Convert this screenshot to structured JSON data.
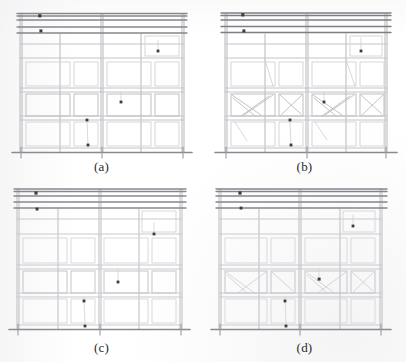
{
  "figure": {
    "kind": "scanned-engineering-drawing",
    "caption_style": "lettered-subfigures",
    "panel_count": 4,
    "background_color": "#ffffff",
    "line_color": "#b9b9bd",
    "heavy_line_color": "#7c7c82",
    "marker_color": "#3a3a3a",
    "crack_color": "#c2c2c6"
  },
  "panels": [
    {
      "id": "a",
      "label": "(a)",
      "damage_state": "none",
      "crack_bays": [],
      "markers": [
        {
          "name": "marker-top-left-upper",
          "x": 40,
          "y": 16
        },
        {
          "name": "marker-top-left-lower",
          "x": 41,
          "y": 31
        },
        {
          "name": "marker-right-upper",
          "x": 158,
          "y": 51
        },
        {
          "name": "marker-mid-center",
          "x": 121,
          "y": 102
        },
        {
          "name": "marker-lower-center-upper",
          "x": 87,
          "y": 120
        },
        {
          "name": "marker-lower-center-lower",
          "x": 88,
          "y": 145
        }
      ]
    },
    {
      "id": "b",
      "label": "(b)",
      "damage_state": "severe-diagonal-shear-cracking",
      "crack_bays": [
        "mid-left-1",
        "mid-left-2",
        "mid-right-1",
        "mid-right-2"
      ],
      "markers": [
        {
          "name": "marker-top-left-upper",
          "x": 40,
          "y": 16
        },
        {
          "name": "marker-top-left-lower",
          "x": 41,
          "y": 31
        },
        {
          "name": "marker-right-upper",
          "x": 158,
          "y": 51
        },
        {
          "name": "marker-mid-center",
          "x": 121,
          "y": 102
        },
        {
          "name": "marker-lower-center-upper",
          "x": 87,
          "y": 120
        },
        {
          "name": "marker-lower-center-lower",
          "x": 88,
          "y": 145
        }
      ]
    },
    {
      "id": "c",
      "label": "(c)",
      "damage_state": "light",
      "crack_bays": [],
      "markers": [
        {
          "name": "marker-top-left-upper",
          "x": 36,
          "y": 12
        },
        {
          "name": "marker-top-left-lower",
          "x": 37,
          "y": 28
        },
        {
          "name": "marker-right-upper",
          "x": 154,
          "y": 53
        },
        {
          "name": "marker-mid-center",
          "x": 118,
          "y": 101
        },
        {
          "name": "marker-lower-center-upper",
          "x": 84,
          "y": 120
        },
        {
          "name": "marker-lower-center-lower",
          "x": 85,
          "y": 145
        }
      ]
    },
    {
      "id": "d",
      "label": "(d)",
      "damage_state": "moderate-diagonal-cracking",
      "crack_bays": [
        "mid-left-1",
        "mid-left-2",
        "mid-right-1",
        "mid-right-2"
      ],
      "markers": [
        {
          "name": "marker-top-left-upper",
          "x": 37,
          "y": 12
        },
        {
          "name": "marker-top-left-lower",
          "x": 38,
          "y": 27
        },
        {
          "name": "marker-right-upper",
          "x": 150,
          "y": 45
        },
        {
          "name": "marker-mid-center",
          "x": 116,
          "y": 98
        },
        {
          "name": "marker-lower-center-upper",
          "x": 82,
          "y": 120
        },
        {
          "name": "marker-lower-center-lower",
          "x": 83,
          "y": 145
        }
      ]
    }
  ],
  "frame_geometry": {
    "columns_x": [
      20,
      60,
      101,
      141,
      182
    ],
    "storey_y": [
      18,
      34,
      58,
      90,
      118,
      152
    ],
    "base_y": 152,
    "roof_band_y": [
      12,
      20,
      27,
      33
    ],
    "bay_count": 4,
    "storey_count": 3
  }
}
